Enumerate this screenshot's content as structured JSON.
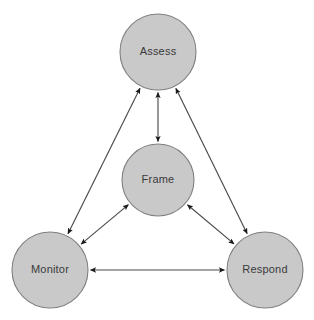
{
  "diagram": {
    "type": "cyclical-node-diagram",
    "canvas": {
      "width": 314,
      "height": 320,
      "background": "#ffffff"
    },
    "style": {
      "node_fill": "#c9c9c9",
      "node_stroke": "#7f7f7f",
      "label_color": "#3a3a3a",
      "edge_color": "#4a4a4a",
      "arrowhead_color": "#1a1a1a"
    },
    "nodes": [
      {
        "id": "assess",
        "label": "Assess",
        "cx": 158,
        "cy": 52,
        "r": 38,
        "position": "top"
      },
      {
        "id": "frame",
        "label": "Frame",
        "cx": 158,
        "cy": 180,
        "r": 36,
        "position": "center"
      },
      {
        "id": "monitor",
        "label": "Monitor",
        "cx": 50,
        "cy": 270,
        "r": 38,
        "position": "bottom-left"
      },
      {
        "id": "respond",
        "label": "Respond",
        "cx": 265,
        "cy": 270,
        "r": 38,
        "position": "bottom-right"
      }
    ],
    "edges": [
      {
        "id": "assess-frame",
        "from": "assess",
        "to": "frame",
        "direction": "bidirectional"
      },
      {
        "id": "assess-monitor",
        "from": "assess",
        "to": "monitor",
        "direction": "bidirectional"
      },
      {
        "id": "assess-respond",
        "from": "assess",
        "to": "respond",
        "direction": "bidirectional"
      },
      {
        "id": "frame-monitor",
        "from": "frame",
        "to": "monitor",
        "direction": "bidirectional"
      },
      {
        "id": "frame-respond",
        "from": "frame",
        "to": "respond",
        "direction": "bidirectional"
      },
      {
        "id": "monitor-respond",
        "from": "monitor",
        "to": "respond",
        "direction": "bidirectional"
      }
    ]
  }
}
